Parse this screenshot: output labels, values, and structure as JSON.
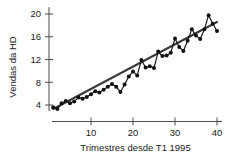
{
  "chart_data": {
    "type": "line",
    "title": "",
    "subtitle": "",
    "xlabel": "Trimestres desde T1 1995",
    "ylabel": "Vendas da HD",
    "xlim": [
      0,
      41
    ],
    "ylim": [
      2.2,
      21.2
    ],
    "xticks": [
      10,
      20,
      30,
      40
    ],
    "yticks": [
      4,
      8,
      12,
      16,
      20
    ],
    "xtick_labels": [
      "10",
      "20",
      "30",
      "40"
    ],
    "ytick_labels": [
      "4",
      "8",
      "12",
      "16",
      "20"
    ],
    "grid": false,
    "legend": "none",
    "marker": "filled-circle",
    "annotations": [],
    "series": [
      {
        "name": "Vendas da HD",
        "style": "line-with-markers",
        "color": "#111111",
        "x": [
          1,
          2,
          3,
          4,
          5,
          6,
          7,
          8,
          9,
          10,
          11,
          12,
          13,
          14,
          15,
          16,
          17,
          18,
          19,
          20,
          21,
          22,
          23,
          24,
          25,
          26,
          27,
          28,
          29,
          30,
          31,
          32,
          33,
          34,
          35,
          36,
          37,
          38,
          39,
          40
        ],
        "values": [
          3.6,
          3.3,
          4.3,
          4.7,
          4.3,
          4.6,
          5.3,
          5.1,
          5.4,
          5.9,
          6.4,
          6.2,
          6.7,
          7.2,
          7.7,
          7.2,
          6.3,
          7.6,
          9.0,
          9.9,
          9.2,
          11.9,
          10.6,
          10.8,
          10.5,
          13.4,
          12.6,
          12.7,
          13.2,
          15.7,
          14.2,
          13.5,
          15.3,
          17.3,
          16.2,
          15.6,
          17.3,
          19.8,
          18.3,
          17.0
        ]
      },
      {
        "name": "Linha de tendencia",
        "style": "trend-line",
        "color": "#3a3a3a",
        "x": [
          1,
          40
        ],
        "values": [
          3.3,
          18.6
        ]
      }
    ]
  },
  "axes": {
    "y_axis_title": "Vendas da HD",
    "x_axis_title": "Trimestres desde T1 1995"
  }
}
